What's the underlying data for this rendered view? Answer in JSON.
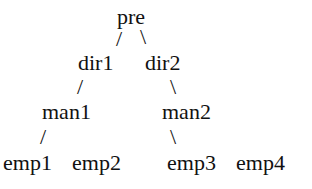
{
  "diagram": {
    "type": "tree",
    "nodes": {
      "pre": "pre",
      "dir1": "dir1",
      "dir2": "dir2",
      "man1": "man1",
      "man2": "man2",
      "emp1": "emp1",
      "emp2": "emp2",
      "emp3": "emp3",
      "emp4": "emp4"
    },
    "edges": {
      "pre_dir1": "/",
      "pre_dir2": "\\",
      "dir1_man1": "/",
      "dir2_man2": "\\",
      "man1_emp1": "/",
      "man2_emp3": "\\"
    }
  }
}
